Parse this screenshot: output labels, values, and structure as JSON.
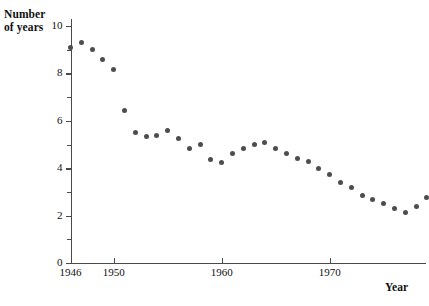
{
  "chart_data": {
    "type": "scatter",
    "title": "",
    "xlabel": "Year",
    "ylabel": "Number of years",
    "ylabel_lines": [
      "Number",
      "of years"
    ],
    "xlim": [
      1946,
      1981
    ],
    "ylim": [
      0,
      10
    ],
    "grid": false,
    "legend": null,
    "marker_color": "#4d4d4d",
    "axis_color": "#4a4a4a",
    "y_ticks": [
      0,
      2,
      4,
      6,
      8,
      10
    ],
    "y_tick_labels": [
      "0",
      "2",
      "4",
      "6",
      "8",
      "10"
    ],
    "y_minor_ticks": [
      1,
      3,
      5,
      7,
      9
    ],
    "x_ticks": [
      1946,
      1950,
      1960,
      1970
    ],
    "x_tick_labels": [
      "1946",
      "1950",
      "1960",
      "1970"
    ],
    "x": [
      1946,
      1947,
      1948,
      1949,
      1950,
      1951,
      1952,
      1953,
      1954,
      1955,
      1956,
      1957,
      1958,
      1959,
      1960,
      1961,
      1962,
      1963,
      1964,
      1965,
      1966,
      1967,
      1968,
      1969,
      1970,
      1971,
      1972,
      1973,
      1974,
      1975,
      1976,
      1977,
      1978,
      1979
    ],
    "values": [
      9.1,
      9.3,
      9.0,
      8.6,
      8.15,
      6.45,
      5.5,
      5.35,
      5.4,
      5.6,
      5.25,
      4.85,
      5.0,
      4.35,
      4.25,
      4.6,
      4.85,
      5.0,
      5.1,
      4.85,
      4.6,
      4.4,
      4.3,
      4.0,
      3.75,
      3.4,
      3.2,
      2.85,
      2.7,
      2.5,
      2.3,
      2.15,
      2.4,
      2.75
    ]
  }
}
